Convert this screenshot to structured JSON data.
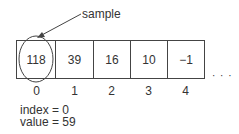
{
  "annotation": {
    "label": "sample"
  },
  "array": {
    "cells": [
      {
        "value": "118",
        "index": "0"
      },
      {
        "value": "39",
        "index": "1"
      },
      {
        "value": "16",
        "index": "2"
      },
      {
        "value": "10",
        "index": "3"
      },
      {
        "value": "−1",
        "index": "4"
      }
    ],
    "continuation": "· · ·"
  },
  "variables": {
    "index_line": "index = 0",
    "value_line": "value = 59"
  }
}
